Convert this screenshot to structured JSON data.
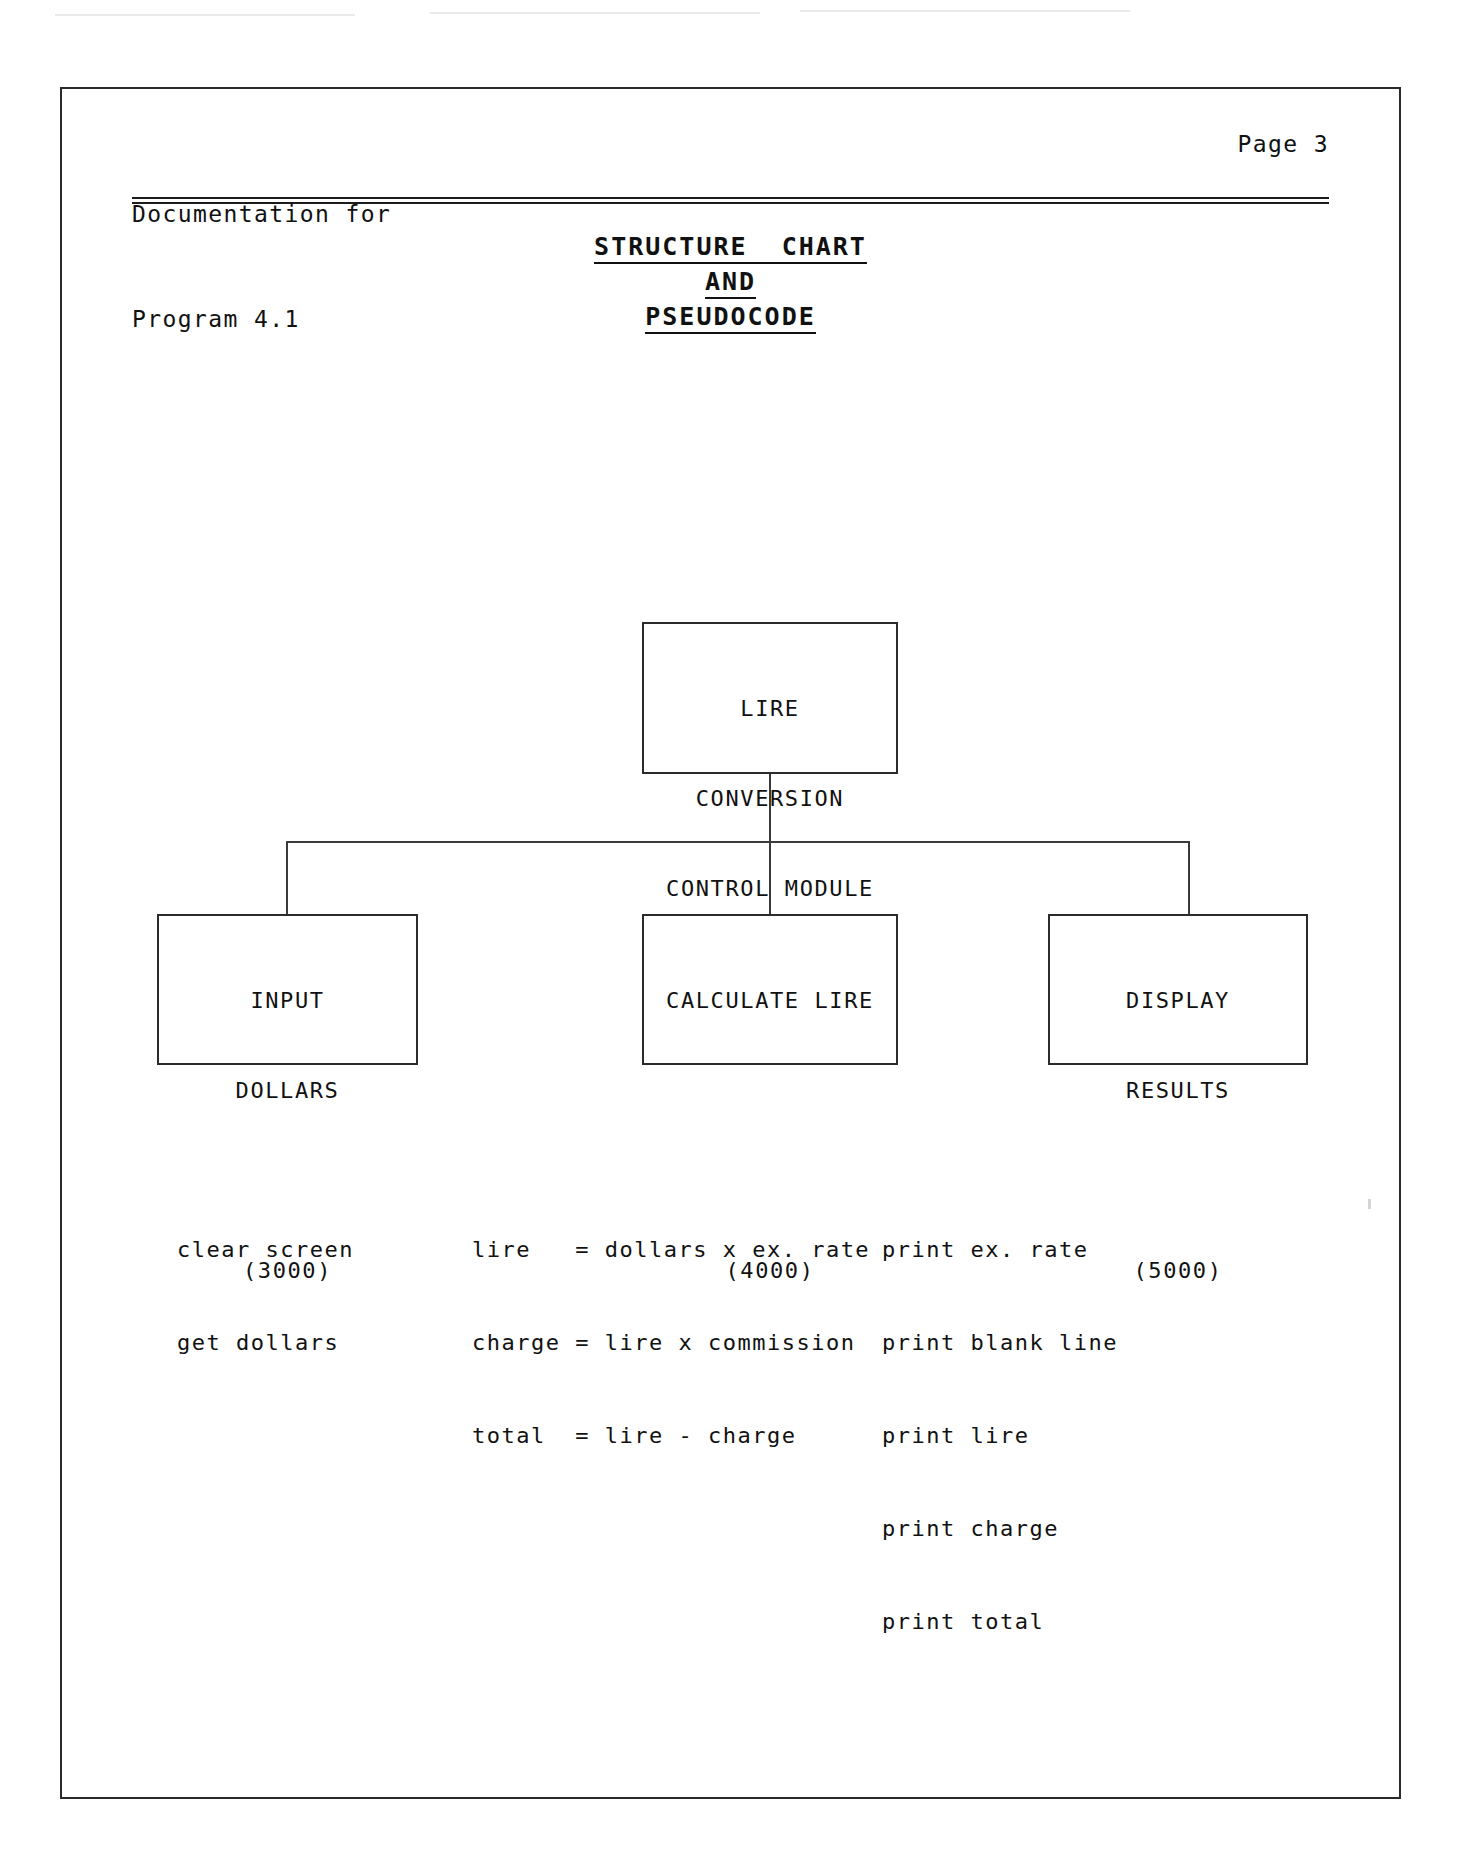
{
  "page": {
    "header": {
      "line_1": "Documentation for",
      "line_2": "Program 4.1",
      "page_label": "Page 3"
    },
    "title": {
      "line_1": "STRUCTURE  CHART",
      "line_2": "AND",
      "line_3": "PSEUDOCODE"
    },
    "scan_artifact_text": "           "
  },
  "chart_data": {
    "type": "diagram",
    "title": "STRUCTURE CHART AND PSEUDOCODE",
    "diagram_kind": "structure-chart",
    "nodes": [
      {
        "id": "root",
        "lines": [
          "LIRE",
          "CONVERSION",
          "CONTROL MODULE",
          "(2000)"
        ],
        "label": "LIRE CONVERSION CONTROL MODULE",
        "number": "(2000)",
        "level": 0
      },
      {
        "id": "input",
        "lines": [
          "INPUT",
          "DOLLARS",
          "",
          "(3000)"
        ],
        "label": "INPUT DOLLARS",
        "number": "(3000)",
        "level": 1
      },
      {
        "id": "calculate",
        "lines": [
          "CALCULATE LIRE",
          "",
          "",
          "(4000)"
        ],
        "label": "CALCULATE LIRE",
        "number": "(4000)",
        "level": 1
      },
      {
        "id": "display",
        "lines": [
          "DISPLAY",
          "RESULTS",
          "",
          "(5000)"
        ],
        "label": "DISPLAY RESULTS",
        "number": "(5000)",
        "level": 1
      }
    ],
    "edges": [
      {
        "from": "root",
        "to": "input"
      },
      {
        "from": "root",
        "to": "calculate"
      },
      {
        "from": "root",
        "to": "display"
      }
    ]
  },
  "pseudocode": {
    "input_dollars": {
      "line_1": "clear screen",
      "line_2": "get dollars"
    },
    "calculate_lire": {
      "line_1": "lire   = dollars x ex. rate",
      "line_2": "charge = lire x commission",
      "line_3": "total  = lire - charge"
    },
    "display_results": {
      "line_1": "print ex. rate",
      "line_2": "print blank line",
      "line_3": "print lire",
      "line_4": "print charge",
      "line_5": "print total"
    }
  },
  "boxes": {
    "root": {
      "line_1": "LIRE",
      "line_2": "CONVERSION",
      "line_3": "CONTROL MODULE",
      "line_4": "(2000)"
    },
    "input": {
      "line_1": "INPUT",
      "line_2": "DOLLARS",
      "line_3": " ",
      "line_4": "(3000)"
    },
    "calculate": {
      "line_1": "CALCULATE LIRE",
      "line_2": " ",
      "line_3": " ",
      "line_4": "(4000)"
    },
    "display": {
      "line_1": "DISPLAY",
      "line_2": "RESULTS",
      "line_3": " ",
      "line_4": "(5000)"
    }
  },
  "colors": {
    "ink": "#111111",
    "paper": "#ffffff",
    "rule": "#1c1c1c",
    "border": "#2b2b2b"
  }
}
